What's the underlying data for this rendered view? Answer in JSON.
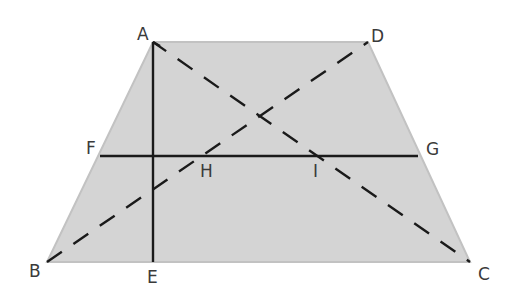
{
  "diagram": {
    "type": "trapezoid-geometry",
    "fill_color": "#d4d4d4",
    "edge_color": "#c2c2c2",
    "line_color": "#1a1a1a",
    "points": {
      "A": {
        "label": "A",
        "x": 153,
        "y": 42,
        "lx": 137,
        "ly": 40
      },
      "D": {
        "label": "D",
        "x": 368,
        "y": 42,
        "lx": 371,
        "ly": 42
      },
      "C": {
        "label": "C",
        "x": 470,
        "y": 262,
        "lx": 478,
        "ly": 280
      },
      "B": {
        "label": "B",
        "x": 47,
        "y": 262,
        "lx": 29,
        "ly": 277
      },
      "E": {
        "label": "E",
        "x": 153,
        "y": 262,
        "lx": 147,
        "ly": 283
      },
      "F": {
        "label": "F",
        "x": 100,
        "y": 156,
        "lx": 86,
        "ly": 154
      },
      "G": {
        "label": "G",
        "x": 418,
        "y": 156,
        "lx": 426,
        "ly": 155
      },
      "H": {
        "label": "H",
        "x": 197,
        "y": 156,
        "lx": 200,
        "ly": 177
      },
      "I": {
        "label": "I",
        "x": 315,
        "y": 156,
        "lx": 313,
        "ly": 177
      }
    },
    "segments": [
      {
        "name": "AE",
        "style": "solid"
      },
      {
        "name": "FG",
        "style": "solid"
      },
      {
        "name": "AC",
        "style": "dashed"
      },
      {
        "name": "BD",
        "style": "dashed"
      }
    ]
  }
}
